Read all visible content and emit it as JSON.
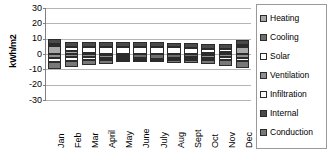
{
  "chart_data": {
    "type": "bar",
    "title": "",
    "subtitle": "",
    "xlabel": "",
    "ylabel": "kWh/m2",
    "stacked": true,
    "grid": true,
    "legend_position": "right",
    "ylim": [
      -30,
      30
    ],
    "y_ticks": [
      30,
      20,
      10,
      0,
      -10,
      -20,
      -30
    ],
    "categories": [
      "Jan",
      "Feb",
      "Mar",
      "April",
      "May",
      "June",
      "July",
      "Aug",
      "Sept",
      "Oct",
      "Nov",
      "Dec"
    ],
    "series": [
      {
        "name": "Heating",
        "color": "#a8a8a8",
        "values": [
          5.0,
          1.8,
          0.9,
          0.3,
          0.1,
          0.0,
          0.0,
          0.0,
          0.1,
          0.4,
          1.5,
          4.6
        ]
      },
      {
        "name": "Cooling",
        "color": "#6e6e6e",
        "values": [
          0.0,
          0.0,
          -0.3,
          -0.8,
          -1.6,
          -2.6,
          -3.0,
          -2.8,
          -1.8,
          -0.7,
          -0.1,
          0.0
        ]
      },
      {
        "name": "Solar",
        "color": "#ffffff",
        "values": [
          1.6,
          2.6,
          3.4,
          4.1,
          4.6,
          4.8,
          4.7,
          4.3,
          3.6,
          2.7,
          1.8,
          1.5
        ]
      },
      {
        "name": "Ventilation",
        "color": "#8f8f8f",
        "values": [
          -2.6,
          -2.2,
          -1.9,
          -1.5,
          -1.1,
          -0.8,
          -0.7,
          -0.8,
          -1.1,
          -1.6,
          -2.1,
          -2.5
        ]
      },
      {
        "name": "Infiltration",
        "color": "#fbfbfb",
        "values": [
          -2.4,
          -2.1,
          -1.7,
          -1.3,
          -0.9,
          -0.6,
          -0.5,
          -0.6,
          -0.9,
          -1.4,
          -1.9,
          -2.3
        ]
      },
      {
        "name": "Internal",
        "color": "#4a4a4a",
        "values": [
          3.3,
          3.3,
          3.3,
          3.2,
          3.2,
          3.2,
          3.2,
          3.2,
          3.2,
          3.3,
          3.3,
          3.3
        ]
      },
      {
        "name": "Conduction",
        "color": "#787878",
        "values": [
          -4.8,
          -4.0,
          -3.3,
          -2.6,
          -1.9,
          -1.4,
          -1.2,
          -1.4,
          -1.9,
          -2.7,
          -3.7,
          -4.6
        ]
      }
    ]
  },
  "legend": {
    "items": [
      {
        "label": "Heating",
        "swatch_class": "fill-heating"
      },
      {
        "label": "Cooling",
        "swatch_class": "fill-cooling"
      },
      {
        "label": "Solar",
        "swatch_class": "fill-solar"
      },
      {
        "label": "Ventilation",
        "swatch_class": "fill-ventilation"
      },
      {
        "label": "Infiltration",
        "swatch_class": "fill-infiltration"
      },
      {
        "label": "Internal",
        "swatch_class": "fill-internal"
      },
      {
        "label": "Conduction",
        "swatch_class": "fill-conduction"
      }
    ]
  }
}
